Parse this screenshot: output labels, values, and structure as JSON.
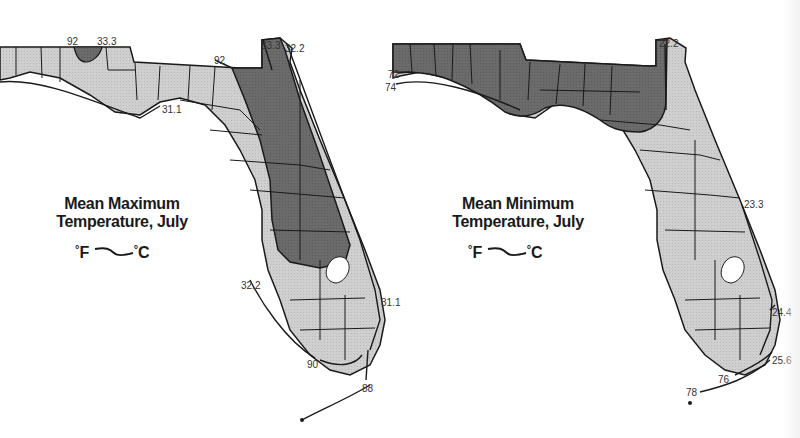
{
  "colors": {
    "background": "#ffffff",
    "land_light": "#cfcfcf",
    "land_dark": "#6b6b6b",
    "lake": "#ffffff",
    "outline": "#1a1a1a",
    "label_text": "#333333"
  },
  "maps": [
    {
      "id": "max",
      "title_line1": "Mean Maximum",
      "title_line2": "Temperature, July",
      "legend": {
        "f_label": "F",
        "c_label": "C",
        "deg": "°"
      },
      "isotherm_labels": [
        {
          "text": "92",
          "x": 67,
          "y": 36
        },
        {
          "text": "33.3",
          "x": 97,
          "y": 36
        },
        {
          "text": "92",
          "x": 214,
          "y": 55
        },
        {
          "text": "33.3",
          "x": 261,
          "y": 40
        },
        {
          "text": "32.2",
          "x": 285,
          "y": 43
        },
        {
          "text": "31.1",
          "x": 162,
          "y": 104
        },
        {
          "text": "32.2",
          "x": 241,
          "y": 280
        },
        {
          "text": "31.1",
          "x": 381,
          "y": 297
        },
        {
          "text": "90",
          "x": 307,
          "y": 359
        },
        {
          "text": "88",
          "x": 362,
          "y": 383
        }
      ]
    },
    {
      "id": "min",
      "title_line1": "Mean Minimum",
      "title_line2": "Temperature, July",
      "legend": {
        "f_label": "F",
        "c_label": "C",
        "deg": "°"
      },
      "isotherm_labels": [
        {
          "text": "72",
          "x": 388,
          "y": 69
        },
        {
          "text": "74",
          "x": 385,
          "y": 82
        },
        {
          "text": "22.2",
          "x": 659,
          "y": 38
        },
        {
          "text": "23.3",
          "x": 744,
          "y": 199
        },
        {
          "text": "24.4",
          "x": 772,
          "y": 307
        },
        {
          "text": "25.6",
          "x": 772,
          "y": 355
        },
        {
          "text": "76",
          "x": 718,
          "y": 374
        },
        {
          "text": "78",
          "x": 686,
          "y": 387
        }
      ]
    }
  ]
}
